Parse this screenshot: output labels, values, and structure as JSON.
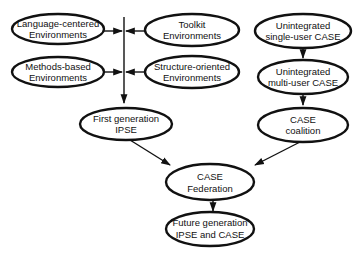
{
  "diagram": {
    "nodes": {
      "language_centered": {
        "line1": "Language-centered",
        "line2": "Environments"
      },
      "toolkit": {
        "line1": "Toolkit",
        "line2": "Environments"
      },
      "methods_based": {
        "line1": "Methods-based",
        "line2": "Environments"
      },
      "structure_oriented": {
        "line1": "Structure-oriented",
        "line2": "Environments"
      },
      "first_generation_ipse": {
        "line1": "First generation",
        "line2": "IPSE"
      },
      "unintegrated_single_user": {
        "line1": "Unintegrated",
        "line2": "single-user CASE"
      },
      "unintegrated_multi_user": {
        "line1": "Unintegrated",
        "line2": "multi-user CASE"
      },
      "case_coalition": {
        "line1": "CASE",
        "line2": "coalition"
      },
      "case_federation": {
        "line1": "CASE",
        "line2": "Federation"
      },
      "future_generation": {
        "line1": "Future generation",
        "line2": "IPSE and CASE"
      }
    },
    "edges": [
      {
        "from": "language_centered",
        "to": "trunk"
      },
      {
        "from": "toolkit",
        "to": "trunk"
      },
      {
        "from": "methods_based",
        "to": "trunk"
      },
      {
        "from": "structure_oriented",
        "to": "trunk"
      },
      {
        "from": "trunk",
        "to": "first_generation_ipse"
      },
      {
        "from": "unintegrated_single_user",
        "to": "unintegrated_multi_user"
      },
      {
        "from": "unintegrated_multi_user",
        "to": "case_coalition"
      },
      {
        "from": "first_generation_ipse",
        "to": "case_federation"
      },
      {
        "from": "case_coalition",
        "to": "case_federation"
      },
      {
        "from": "case_federation",
        "to": "future_generation"
      }
    ]
  }
}
